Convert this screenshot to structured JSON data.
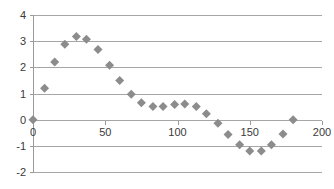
{
  "chart_data": {
    "type": "scatter",
    "title": "",
    "subtitle": "",
    "xlabel": "",
    "ylabel": "",
    "xlim": [
      0,
      200
    ],
    "ylim": [
      -2,
      4
    ],
    "xticks": [
      0,
      50,
      100,
      150,
      200
    ],
    "yticks": [
      -2,
      -1,
      0,
      1,
      2,
      3,
      4
    ],
    "xtick_labels": [
      "0",
      "50",
      "100",
      "150",
      "200"
    ],
    "ytick_labels": [
      "-2",
      "-1",
      "0",
      "1",
      "2",
      "3",
      "4"
    ],
    "grid": "horizontal",
    "legend": "none",
    "marker": "diamond",
    "marker_color": "#8c8c8c",
    "marker_size": 7,
    "series": [
      {
        "name": "series-1",
        "points": [
          [
            0,
            0.0
          ],
          [
            8,
            1.2
          ],
          [
            15,
            2.2
          ],
          [
            22,
            2.88
          ],
          [
            30,
            3.18
          ],
          [
            37,
            3.07
          ],
          [
            45,
            2.68
          ],
          [
            53,
            2.08
          ],
          [
            60,
            1.5
          ],
          [
            68,
            0.97
          ],
          [
            75,
            0.65
          ],
          [
            83,
            0.5
          ],
          [
            90,
            0.5
          ],
          [
            98,
            0.58
          ],
          [
            105,
            0.6
          ],
          [
            113,
            0.5
          ],
          [
            120,
            0.23
          ],
          [
            128,
            -0.14
          ],
          [
            135,
            -0.57
          ],
          [
            143,
            -0.96
          ],
          [
            150,
            -1.2
          ],
          [
            158,
            -1.2
          ],
          [
            165,
            -0.96
          ],
          [
            173,
            -0.55
          ],
          [
            180,
            0.0
          ]
        ]
      }
    ]
  }
}
